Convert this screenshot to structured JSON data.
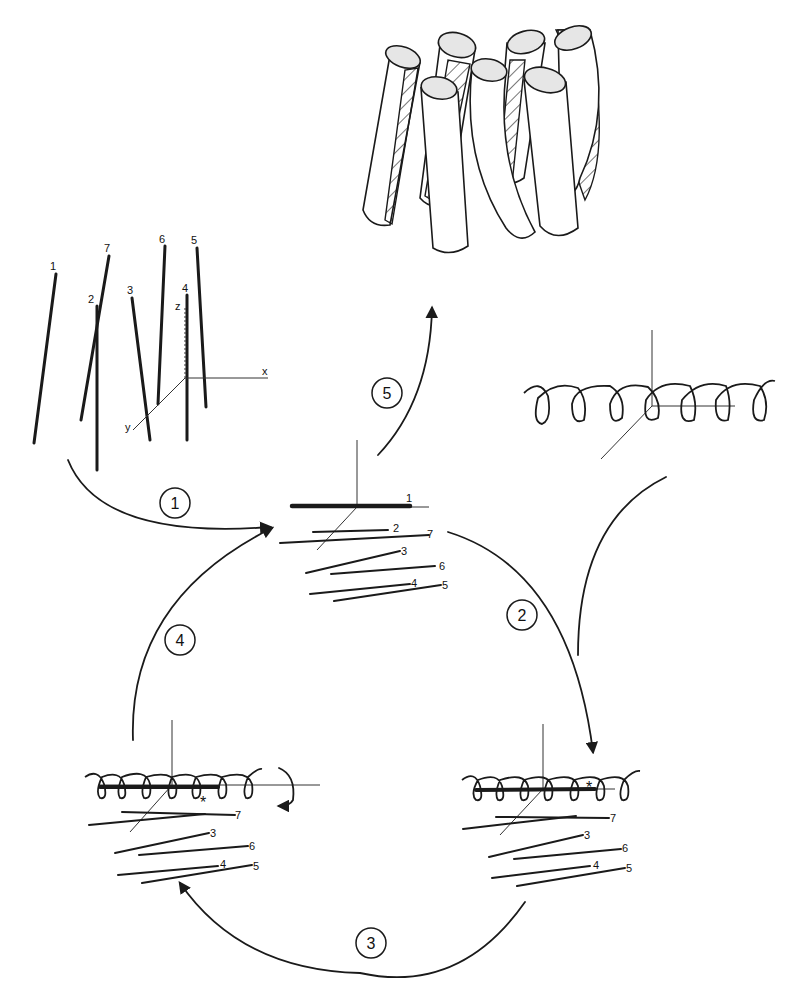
{
  "diagram": {
    "type": "process-cycle",
    "steps": [
      {
        "id": 1,
        "label": "1",
        "from": "initial-helices",
        "to": "aligned-helices"
      },
      {
        "id": 2,
        "label": "2",
        "from": "aligned-helices",
        "to": "coil-docked-right"
      },
      {
        "id": 3,
        "label": "3",
        "from": "coil-docked-right",
        "to": "coil-docked-left"
      },
      {
        "id": 4,
        "label": "4",
        "from": "coil-docked-left",
        "to": "aligned-helices"
      },
      {
        "id": 5,
        "label": "5",
        "from": "aligned-helices",
        "to": "cylinder-bundle"
      }
    ],
    "axes": {
      "x": "x",
      "y": "y",
      "z": "z"
    },
    "initial_helices": {
      "labels": [
        "1",
        "7",
        "2",
        "3",
        "6",
        "4",
        "5"
      ]
    },
    "aligned_helices": {
      "labels": [
        "1",
        "2",
        "7",
        "3",
        "6",
        "4",
        "5"
      ]
    },
    "docked_left": {
      "labels": [
        "7",
        "3",
        "6",
        "4",
        "5"
      ],
      "marker": "*"
    },
    "docked_right": {
      "labels": [
        "7",
        "3",
        "6",
        "4",
        "5"
      ],
      "marker": "*"
    },
    "cylinder_bundle": {
      "count": 7
    },
    "colors": {
      "ink": "#1a1a1a",
      "background": "#ffffff",
      "cap_fill": "#e6e6e6"
    }
  }
}
